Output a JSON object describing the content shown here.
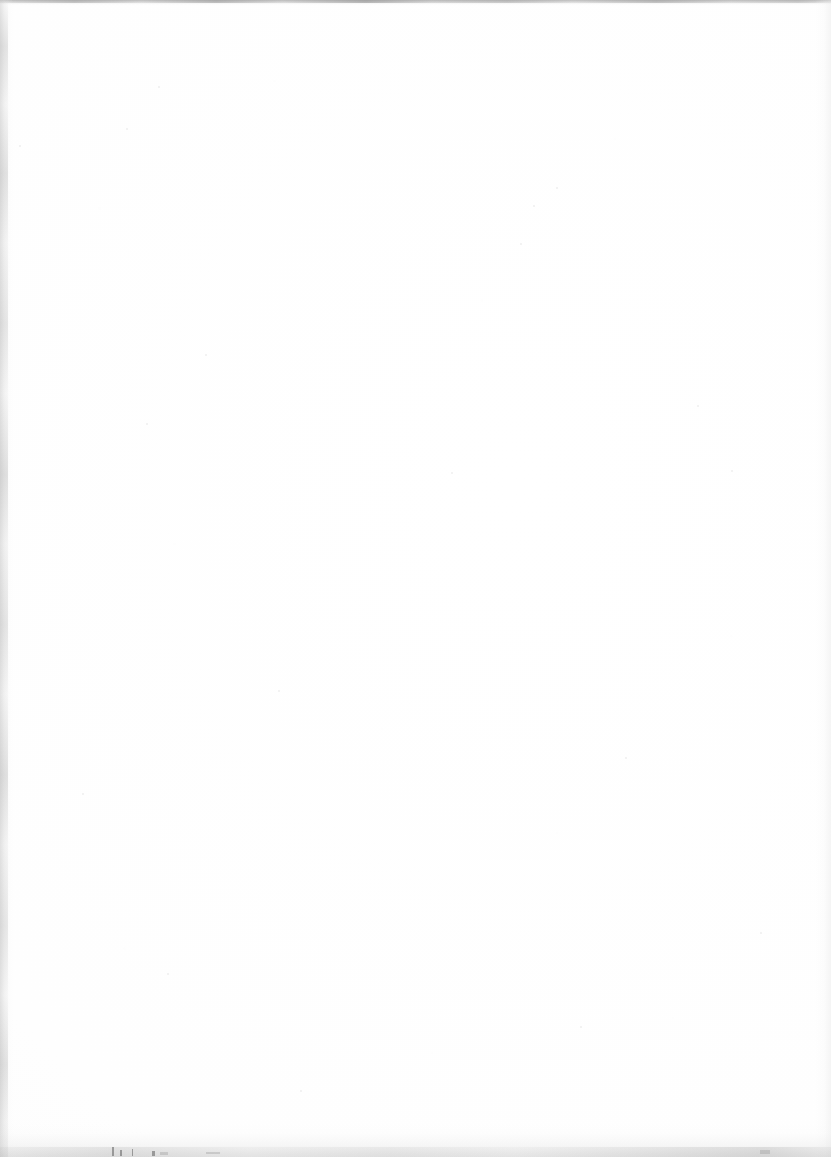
{
  "page": {
    "kind": "scanned-blank-page",
    "width": 831,
    "height": 1157,
    "visible_text": "",
    "note": "Blank page of a scanned document. No text, figures, headers, folios or captions are rendered anywhere in the image.",
    "paper_color": "#fdfdfd",
    "background_color": "#ffffff"
  },
  "scan_artifacts": {
    "top_edge": {
      "name": "top-scan-edge",
      "color": "#9a9a9a",
      "height_px": 5,
      "description": "Thin grey scanner edge band running the full width with irregular darker patches."
    },
    "left_edge": {
      "name": "left-gutter-band",
      "color": "#cdcdcd",
      "width_px": 13,
      "description": "Mottled grey vertical band along the binding gutter."
    },
    "right_edge": {
      "name": "right-scan-falloff",
      "color": "#e8e8e8",
      "width_px": 16,
      "description": "Soft light-grey gradient falloff at the right margin."
    },
    "bottom_edge": {
      "name": "bottom-scan-edge",
      "color": "#c4c4c4",
      "height_px": 34,
      "description": "Soft grey gradient at the bottom with a few tiny dark tick marks."
    },
    "edge_marks": [
      {
        "x": 112,
        "y": 1147,
        "w": 2,
        "h": 9
      },
      {
        "x": 120,
        "y": 1150,
        "w": 2,
        "h": 6
      },
      {
        "x": 132,
        "y": 1149,
        "w": 1,
        "h": 7
      },
      {
        "x": 152,
        "y": 1151,
        "w": 3,
        "h": 5
      },
      {
        "x": 160,
        "y": 1152,
        "w": 8,
        "h": 3
      },
      {
        "x": 206,
        "y": 1152,
        "w": 14,
        "h": 2
      },
      {
        "x": 760,
        "y": 1150,
        "w": 10,
        "h": 4
      }
    ],
    "dust_specks": [
      {
        "x": 158,
        "y": 86
      },
      {
        "x": 126,
        "y": 128
      },
      {
        "x": 19,
        "y": 145
      },
      {
        "x": 533,
        "y": 205
      },
      {
        "x": 520,
        "y": 243
      },
      {
        "x": 556,
        "y": 187
      },
      {
        "x": 205,
        "y": 354
      },
      {
        "x": 697,
        "y": 405
      },
      {
        "x": 146,
        "y": 423
      },
      {
        "x": 731,
        "y": 470
      },
      {
        "x": 451,
        "y": 472
      },
      {
        "x": 278,
        "y": 690
      },
      {
        "x": 625,
        "y": 757
      },
      {
        "x": 82,
        "y": 793
      },
      {
        "x": 167,
        "y": 973
      },
      {
        "x": 580,
        "y": 1026
      },
      {
        "x": 300,
        "y": 1090
      },
      {
        "x": 760,
        "y": 932
      }
    ]
  }
}
